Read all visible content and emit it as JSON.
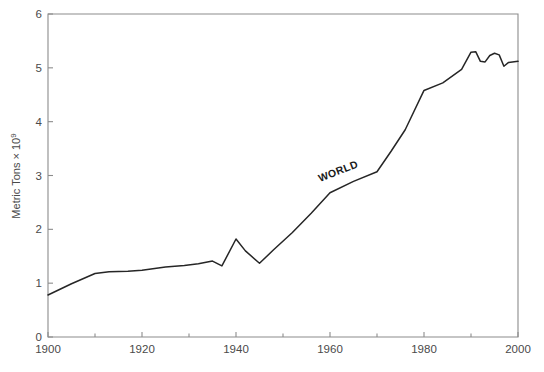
{
  "chart_data": {
    "type": "line",
    "title": "",
    "subtitle": "",
    "xlabel": "",
    "ylabel": "Metric Tons × 10",
    "ylabel_exponent": "9",
    "ylabel_full": "Metric Tons × 10⁹",
    "xlim": [
      1900,
      2000
    ],
    "ylim": [
      0,
      6
    ],
    "grid": false,
    "legend_position": "inline-annotation",
    "x_ticks": [
      1900,
      1920,
      1940,
      1960,
      1980,
      2000
    ],
    "x_tick_labels": [
      "1900",
      "1920",
      "1940",
      "1960",
      "1980",
      "2000"
    ],
    "x_minor_ticks": [
      1910,
      1930,
      1950,
      1970,
      1990
    ],
    "y_ticks": [
      0,
      1,
      2,
      3,
      4,
      5,
      6
    ],
    "y_tick_labels": [
      "0",
      "1",
      "2",
      "3",
      "4",
      "5",
      "6"
    ],
    "line_color": "#262626",
    "axis_color": "#8c8c8c",
    "background_color": "#ffffff",
    "annotations": [
      {
        "text": "WORLD",
        "x": 1962,
        "y": 3.02,
        "rotation": -21
      }
    ],
    "series": [
      {
        "name": "WORLD",
        "label": "WORLD",
        "x": [
          1900,
          1905,
          1910,
          1913,
          1917,
          1920,
          1925,
          1929,
          1932,
          1935,
          1937,
          1940,
          1942,
          1945,
          1948,
          1952,
          1956,
          1960,
          1965,
          1970,
          1973,
          1976,
          1980,
          1984,
          1988,
          1990,
          1991,
          1992,
          1993,
          1994,
          1995,
          1996,
          1997,
          1998,
          2000
        ],
        "values": [
          0.78,
          0.99,
          1.18,
          1.21,
          1.22,
          1.24,
          1.3,
          1.33,
          1.36,
          1.41,
          1.32,
          1.82,
          1.6,
          1.37,
          1.62,
          1.94,
          2.3,
          2.68,
          2.89,
          3.07,
          3.45,
          3.85,
          4.58,
          4.72,
          4.97,
          5.29,
          5.3,
          5.12,
          5.11,
          5.23,
          5.27,
          5.24,
          5.03,
          5.1,
          5.12
        ]
      }
    ]
  },
  "figure": {
    "plot_area": {
      "left": 48,
      "top": 14,
      "right": 518,
      "bottom": 337
    }
  }
}
